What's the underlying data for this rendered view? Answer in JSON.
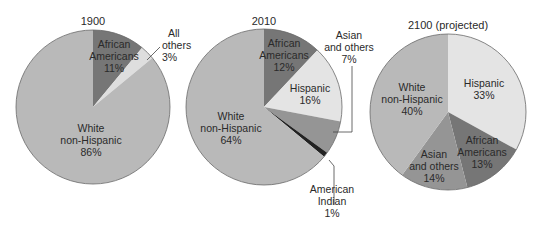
{
  "chart_data": [
    {
      "type": "pie",
      "title": "1900",
      "slices": [
        {
          "label": "African Americans",
          "value": 11,
          "color": "#767676"
        },
        {
          "label": "All others",
          "value": 3,
          "color": "#dedede"
        },
        {
          "label": "White non-Hispanic",
          "value": 86,
          "color": "#b9b9b9"
        }
      ]
    },
    {
      "type": "pie",
      "title": "2010",
      "slices": [
        {
          "label": "African Americans",
          "value": 12,
          "color": "#767676"
        },
        {
          "label": "Hispanic",
          "value": 16,
          "color": "#e4e4e4"
        },
        {
          "label": "Asian and others",
          "value": 7,
          "color": "#959595"
        },
        {
          "label": "American Indian",
          "value": 1,
          "color": "#222222"
        },
        {
          "label": "White non-Hispanic",
          "value": 64,
          "color": "#b9b9b9"
        }
      ]
    },
    {
      "type": "pie",
      "title": "2100 (projected)",
      "slices": [
        {
          "label": "Hispanic",
          "value": 33,
          "color": "#e4e4e4"
        },
        {
          "label": "African Americans",
          "value": 13,
          "color": "#767676"
        },
        {
          "label": "Asian and others",
          "value": 14,
          "color": "#959595"
        },
        {
          "label": "White non-Hispanic",
          "value": 40,
          "color": "#b9b9b9"
        }
      ]
    }
  ],
  "labels": {
    "p1": {
      "title": "1900",
      "aa": [
        "African",
        "Americans",
        "11%"
      ],
      "others": [
        "All",
        "others",
        "3%"
      ],
      "white": [
        "White",
        "non-Hispanic",
        "86%"
      ]
    },
    "p2": {
      "title": "2010",
      "aa": [
        "African",
        "Americans",
        "12%"
      ],
      "hisp": [
        "Hispanic",
        "16%"
      ],
      "asian": [
        "Asian",
        "and others",
        "7%"
      ],
      "indian": [
        "American",
        "Indian",
        "1%"
      ],
      "white": [
        "White",
        "non-Hispanic",
        "64%"
      ]
    },
    "p3": {
      "title": "2100 (projected)",
      "hisp": [
        "Hispanic",
        "33%"
      ],
      "aa": [
        "African",
        "Americans",
        "13%"
      ],
      "asian": [
        "Asian",
        "and others",
        "14%"
      ],
      "white": [
        "White",
        "non-Hispanic",
        "40%"
      ]
    }
  }
}
